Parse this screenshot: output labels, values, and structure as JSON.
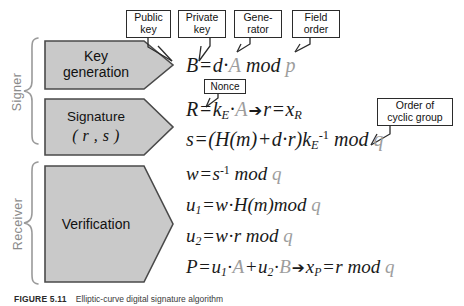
{
  "figure": {
    "caption_number": "FIGURE 5.11",
    "caption_text": "Elliptic-curve digital signature algorithm"
  },
  "roles": [
    {
      "id": "signer",
      "label": "Signer"
    },
    {
      "id": "receiver",
      "label": "Receiver"
    }
  ],
  "stages": [
    {
      "id": "key-generation",
      "line1": "Key",
      "line2": "generation"
    },
    {
      "id": "signature",
      "line1": "Signature",
      "line2": "( r , s )"
    },
    {
      "id": "verification",
      "line1": "Verification",
      "line2": ""
    }
  ],
  "callouts": [
    {
      "id": "public-key",
      "line1": "Public",
      "line2": "key"
    },
    {
      "id": "private-key",
      "line1": "Private",
      "line2": "key"
    },
    {
      "id": "generator",
      "line1": "Gene-",
      "line2": "rator"
    },
    {
      "id": "field-order",
      "line1": "Field",
      "line2": "order"
    },
    {
      "id": "nonce",
      "line1": "Nonce",
      "line2": ""
    },
    {
      "id": "order-cyclic",
      "line1": "Order of",
      "line2": "cyclic group"
    }
  ],
  "equations": {
    "key_generation": {
      "id": "eq-public-key",
      "text": "B = d · A mod p",
      "parts": {
        "lhs": "B",
        "eq": "=",
        "d": "d",
        "dot": "·",
        "A": "A",
        "mod": "mod",
        "p": "p"
      }
    },
    "signature_R": {
      "id": "eq-R",
      "text": "R = kE · A → r = xR",
      "parts": {
        "lhs": "R",
        "eq": "=",
        "k": "k",
        "k_sub": "E",
        "dot": "·",
        "A": "A",
        "arrow": "➔",
        "r": "r",
        "eq2": "=",
        "x": "x",
        "x_sub": "R"
      }
    },
    "signature_s": {
      "id": "eq-s",
      "text": "s = ( H ( m ) + d · r ) kE^-1 mod q",
      "parts": {
        "lhs": "s",
        "eq": "=",
        "open": "(",
        "H": "H",
        "mopen": "(",
        "m": "m",
        "mclose": ")",
        "plus": "+",
        "d": "d",
        "dot": "·",
        "r": "r",
        "close": ")",
        "k": "k",
        "k_sub": "E",
        "k_sup": "-1",
        "mod": "mod",
        "q": "q"
      }
    },
    "verify_w": {
      "id": "eq-w",
      "text": "w = s^-1 mod q",
      "parts": {
        "lhs": "w",
        "eq": "=",
        "s": "s",
        "s_sup": "-1",
        "mod": "mod",
        "q": "q"
      }
    },
    "verify_u1": {
      "id": "eq-u1",
      "text": "u1 = w · H ( m ) mod q",
      "parts": {
        "lhs": "u",
        "lhs_sub": "1",
        "eq": "=",
        "w": "w",
        "dot": "·",
        "H": "H",
        "mopen": "(",
        "m": "m",
        "mclose": ")",
        "mod": "mod",
        "q": "q"
      }
    },
    "verify_u2": {
      "id": "eq-u2",
      "text": "u2 = w · r mod q",
      "parts": {
        "lhs": "u",
        "lhs_sub": "2",
        "eq": "=",
        "w": "w",
        "dot": "·",
        "r": "r",
        "mod": "mod",
        "q": "q"
      }
    },
    "verify_P": {
      "id": "eq-P",
      "text": "P = u1 · A + u2 · B → xP = r mod q",
      "parts": {
        "lhs": "P",
        "eq": "=",
        "u": "u",
        "u_sub": "1",
        "dot": "·",
        "A": "A",
        "plus": "+",
        "u2": "u",
        "u2_sub": "2",
        "dot2": "·",
        "B": "B",
        "arrow": "➔",
        "x": "x",
        "x_sub": "P",
        "eq2": "=",
        "r": "r",
        "mod": "mod",
        "q": "q"
      }
    }
  },
  "colors": {
    "box_fill": "#c9c9c9",
    "box_border": "#4a4a4a",
    "callout_border": "#2b2b2b",
    "equation_text": "#1a1a1a",
    "equation_gray": "#9d9d9d",
    "role_label": "#8a8a8a",
    "background": "#ffffff"
  }
}
